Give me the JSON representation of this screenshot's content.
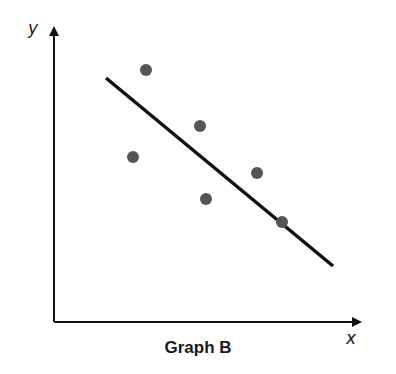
{
  "chart_data": {
    "type": "scatter",
    "title": "Graph B",
    "xlabel": "x",
    "ylabel": "y",
    "grid": false,
    "points": [
      {
        "px": 146,
        "py": 70
      },
      {
        "px": 133,
        "py": 157
      },
      {
        "px": 200,
        "py": 126
      },
      {
        "px": 206,
        "py": 199
      },
      {
        "px": 257,
        "py": 173
      },
      {
        "px": 282,
        "py": 222
      }
    ],
    "trend_line": {
      "x1": 106,
      "y1": 78,
      "x2": 333,
      "y2": 266,
      "description": "negative correlation line of best fit"
    },
    "colors": {
      "points": "#555555",
      "line": "#111111",
      "axes": "#111111"
    }
  }
}
